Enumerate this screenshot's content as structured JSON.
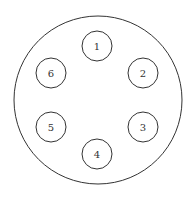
{
  "diagram": {
    "outer_circle": {
      "cx": 98,
      "cy": 100,
      "r": 84,
      "stroke": "#333333"
    },
    "nodes": [
      {
        "label": "1",
        "cx": 97,
        "cy": 46
      },
      {
        "label": "2",
        "cx": 143,
        "cy": 73
      },
      {
        "label": "3",
        "cx": 143,
        "cy": 127
      },
      {
        "label": "4",
        "cx": 97,
        "cy": 154
      },
      {
        "label": "5",
        "cx": 51,
        "cy": 127
      },
      {
        "label": "6",
        "cx": 51,
        "cy": 73
      }
    ],
    "node_radius": 15
  }
}
